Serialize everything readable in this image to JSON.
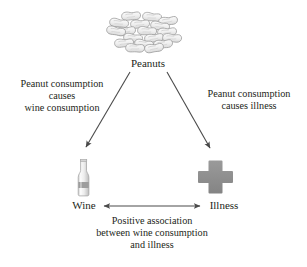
{
  "diagram": {
    "nodes": [
      {
        "id": "peanuts",
        "label": "Peanuts",
        "icon": "peanut-cluster-icon"
      },
      {
        "id": "wine",
        "label": "Wine",
        "icon": "wine-bottle-icon"
      },
      {
        "id": "illness",
        "label": "Illness",
        "icon": "medical-cross-icon"
      }
    ],
    "edges": [
      {
        "id": "peanuts-to-wine",
        "from": "peanuts",
        "to": "wine",
        "arrow": "single",
        "label_lines": [
          "Peanut consumption",
          "causes",
          "wine consumption"
        ]
      },
      {
        "id": "peanuts-to-illness",
        "from": "peanuts",
        "to": "illness",
        "arrow": "single",
        "label_lines": [
          "Peanut consumption",
          "causes illness"
        ]
      },
      {
        "id": "wine-illness-association",
        "from": "wine",
        "to": "illness",
        "arrow": "double",
        "label_lines": [
          "Positive association",
          "between wine consumption",
          "and illness"
        ]
      }
    ],
    "colors": {
      "text": "#231f20",
      "arrow": "#4a4a4a",
      "cross": "#8a8a8a",
      "peanut_fill": "#efefef",
      "peanut_stroke": "#9a9a9a",
      "bottle_fill": "#f2f2f2",
      "bottle_stroke": "#9d9d9d",
      "bottle_band": "#9a9a9a",
      "background": "#ffffff"
    }
  }
}
